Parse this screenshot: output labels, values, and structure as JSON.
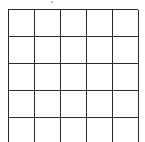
{
  "grid": {
    "columns": 5,
    "rows_visible": 5,
    "line_color": "#2a2a2a",
    "background": "#ffffff",
    "cells": [
      [
        "",
        "",
        "",
        "",
        ""
      ],
      [
        "",
        "",
        "",
        "",
        ""
      ],
      [
        "",
        "",
        "",
        "",
        ""
      ],
      [
        "",
        "",
        "",
        "",
        ""
      ],
      [
        "",
        "",
        "",
        "",
        ""
      ]
    ]
  }
}
